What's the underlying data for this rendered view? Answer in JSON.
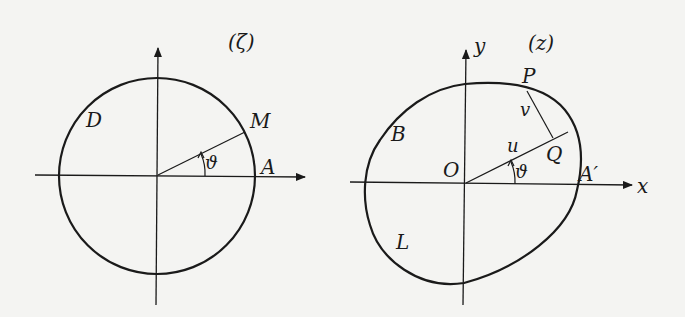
{
  "left_diagram": {
    "title": "(ζ)",
    "labels": {
      "D": "D",
      "M": "M",
      "A": "A",
      "theta": "ϑ"
    }
  },
  "right_diagram": {
    "title": "(z)",
    "labels": {
      "y": "y",
      "x": "x",
      "P": "P",
      "v": "v",
      "u": "u",
      "B": "B",
      "O": "O",
      "Q": "Q",
      "theta": "ϑ",
      "A_prime": "A′",
      "L": "L"
    }
  },
  "colors": {
    "ink": "#1a1a1a",
    "paper": "#f4f4f2"
  }
}
